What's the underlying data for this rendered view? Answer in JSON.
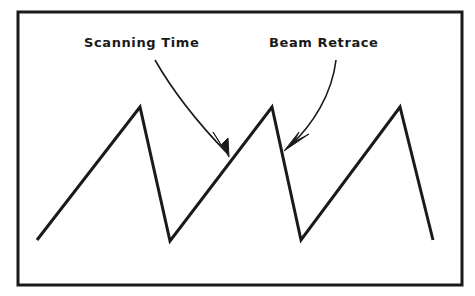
{
  "figure": {
    "type": "waveform-diagram",
    "background_color": "#ffffff",
    "stroke_color": "#1a1a1a",
    "border": {
      "name": "figure-border",
      "x": 18,
      "y": 12,
      "width": 444,
      "height": 273,
      "stroke_width": 3
    },
    "labels": [
      {
        "id": "scanning-time",
        "text": "Scanning Time",
        "x": 84,
        "y": 36
      },
      {
        "id": "beam-retrace",
        "text": "Beam Retrace",
        "x": 269,
        "y": 36
      }
    ],
    "callouts": [
      {
        "id": "scanning-time-leader",
        "from_label": "Scanning Time",
        "path": "M 155 60 C 175 95, 200 125, 226 152",
        "arrow_tip": [
          229,
          156
        ],
        "arrow_direction": "down-right"
      },
      {
        "id": "beam-retrace-leader",
        "from_label": "Beam Retrace",
        "path": "M 336 60 C 332 95, 312 125, 291 145",
        "arrow_tip": [
          286,
          149
        ],
        "arrow_direction": "down-left"
      }
    ]
  },
  "chart_data": {
    "type": "line",
    "title": "",
    "xlabel": "",
    "ylabel": "",
    "grid": false,
    "legend": "none",
    "annotations": [
      {
        "text": "Scanning Time",
        "points_to": "rising ramp segment",
        "tip_x": 229,
        "tip_y": 156
      },
      {
        "text": "Beam Retrace",
        "points_to": "falling retrace segment",
        "tip_x": 286,
        "tip_y": 149
      }
    ],
    "series": [
      {
        "name": "sawtooth-trace",
        "points": [
          [
            37,
            240
          ],
          [
            140,
            107
          ],
          [
            170,
            241
          ],
          [
            272,
            107
          ],
          [
            301,
            240
          ],
          [
            400,
            107
          ],
          [
            433,
            240
          ]
        ]
      }
    ],
    "xlim": [
      18,
      462
    ],
    "ylim": [
      285,
      12
    ]
  }
}
